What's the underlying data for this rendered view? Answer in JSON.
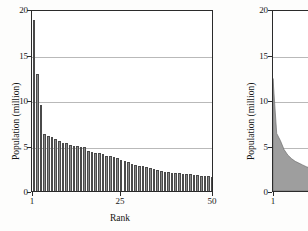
{
  "figure": {
    "background_color": "#fdfdfc",
    "axis_color": "#2b2b2b",
    "grid_color": "#b9b9b9",
    "bar_fill_color": "#8a8a8a",
    "bar_edge_color": "#4a4a4a",
    "area_fill_color": "#9e9e9e"
  },
  "chart_data": [
    {
      "type": "bar",
      "panel": "left",
      "title": "",
      "xlabel": "Rank",
      "ylabel": "Population (million)",
      "xlim": [
        1,
        50
      ],
      "ylim": [
        0,
        20
      ],
      "xticks": [
        1,
        25,
        50
      ],
      "xtick_labels": [
        "1",
        "25",
        "50"
      ],
      "yticks": [
        0,
        5,
        10,
        15,
        20
      ],
      "ytick_labels": [
        "0",
        "5",
        "10",
        "15",
        "20"
      ],
      "grid": true,
      "legend": "none",
      "categories": [
        1,
        2,
        3,
        4,
        5,
        6,
        7,
        8,
        9,
        10,
        11,
        12,
        13,
        14,
        15,
        16,
        17,
        18,
        19,
        20,
        21,
        22,
        23,
        24,
        25,
        26,
        27,
        28,
        29,
        30,
        31,
        32,
        33,
        34,
        35,
        36,
        37,
        38,
        39,
        40,
        41,
        42,
        43,
        44,
        45,
        46,
        47,
        48,
        49,
        50
      ],
      "values": [
        18.8,
        12.9,
        9.5,
        6.3,
        6.1,
        5.9,
        5.7,
        5.5,
        5.3,
        5.3,
        5.1,
        5.0,
        4.9,
        4.85,
        4.8,
        4.4,
        4.3,
        4.2,
        4.15,
        4.1,
        3.9,
        3.8,
        3.7,
        3.6,
        3.45,
        3.3,
        3.2,
        3.0,
        2.9,
        2.8,
        2.7,
        2.6,
        2.5,
        2.4,
        2.3,
        2.25,
        2.1,
        2.05,
        2.0,
        2.0,
        1.95,
        1.9,
        1.85,
        1.85,
        1.8,
        1.75,
        1.7,
        1.65,
        1.6,
        1.55
      ]
    },
    {
      "type": "area",
      "panel": "right",
      "title": "",
      "xlabel": "",
      "ylabel": "Population (million)",
      "xlim": [
        1,
        50
      ],
      "ylim": [
        0,
        20
      ],
      "xticks": [
        1
      ],
      "xtick_labels": [
        "1"
      ],
      "yticks": [
        0,
        5,
        10,
        15,
        20
      ],
      "ytick_labels": [
        "0",
        "5",
        "10",
        "15",
        "20"
      ],
      "grid": true,
      "legend": "none",
      "note": "panel is cropped by the right edge of the image",
      "x": [
        1,
        2,
        3,
        4,
        5,
        6,
        7,
        8,
        9,
        10,
        12,
        14,
        16,
        18,
        20,
        24,
        28,
        32,
        36,
        40,
        45,
        50
      ],
      "y": [
        12.5,
        6.4,
        5.6,
        4.6,
        4.0,
        3.6,
        3.3,
        3.1,
        2.9,
        2.7,
        2.4,
        2.2,
        2.0,
        1.85,
        1.7,
        1.45,
        1.25,
        1.1,
        0.95,
        0.85,
        0.72,
        0.6
      ]
    }
  ],
  "left_panel": {
    "y_axis_title": "Population (million)",
    "x_axis_title": "Rank",
    "y_tick_20": "20",
    "y_tick_15": "15",
    "y_tick_10": "10",
    "y_tick_5": "5",
    "y_tick_0": "0",
    "x_tick_1": "1",
    "x_tick_25": "25",
    "x_tick_50": "50"
  },
  "right_panel": {
    "y_axis_title": "Population (million)",
    "y_tick_20": "20",
    "y_tick_15": "15",
    "y_tick_10": "10",
    "y_tick_5": "5",
    "y_tick_0": "0",
    "x_tick_1": "1"
  }
}
